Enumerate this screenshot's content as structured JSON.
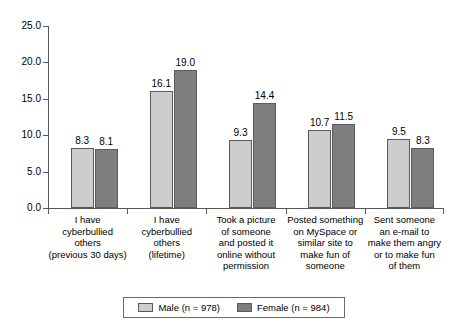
{
  "chart_data": {
    "type": "bar",
    "title": "",
    "subtitle": "",
    "xlabel": "",
    "ylabel": "",
    "ylim": [
      0.0,
      25.0
    ],
    "ytick_labels": [
      "0.0",
      "5.0",
      "10.0",
      "15.0",
      "20.0",
      "25.0"
    ],
    "ytick_values": [
      0.0,
      5.0,
      10.0,
      15.0,
      20.0,
      25.0
    ],
    "grid": false,
    "legend_position": "bottom",
    "categories": [
      "I have\ncyberbullied\nothers\n(previous 30 days)",
      "I have\ncyberbullied\nothers\n(lifetime)",
      "Took a picture\nof someone\nand posted it\nonline without\npermission",
      "Posted something\non MySpace or\nsimilar site to\nmake fun of\nsomeone",
      "Sent someone\nan e-mail to\nmake them angry\nor to make fun\nof them"
    ],
    "category_lines": [
      [
        "I have",
        "cyberbullied",
        "others",
        "(previous 30 days)"
      ],
      [
        "I have",
        "cyberbullied",
        "others",
        "(lifetime)"
      ],
      [
        "Took a picture",
        "of someone",
        "and posted it",
        "online without",
        "permission"
      ],
      [
        "Posted something",
        "on MySpace or",
        "similar site to",
        "make fun of",
        "someone"
      ],
      [
        "Sent someone",
        "an e-mail to",
        "make them angry",
        "or to make fun",
        "of them"
      ]
    ],
    "series": [
      {
        "name": "Male (n = 978)",
        "short_name": "Male",
        "n": 978,
        "color": "#cdcdcd",
        "values": [
          8.3,
          16.1,
          9.3,
          10.7,
          9.5
        ],
        "labels": [
          "8.3",
          "16.1",
          "9.3",
          "10.7",
          "9.5"
        ]
      },
      {
        "name": "Female (n = 984)",
        "short_name": "Female",
        "n": 984,
        "color": "#7e7e7e",
        "values": [
          8.1,
          19.0,
          14.4,
          11.5,
          8.3
        ],
        "labels": [
          "8.1",
          "19.0",
          "14.4",
          "11.5",
          "8.3"
        ]
      }
    ]
  },
  "legend": {
    "entries": [
      {
        "label": "Male (n = 978)",
        "color": "#cdcdcd"
      },
      {
        "label": "Female (n = 984)",
        "color": "#7e7e7e"
      }
    ]
  },
  "axis": {
    "y_labels": [
      "25.0",
      "20.0",
      "15.0",
      "10.0",
      "5.0",
      "0.0"
    ]
  },
  "colors": {
    "male_bar": "#cdcdcd",
    "female_bar": "#7e7e7e",
    "bar_border": "#5b5b5d",
    "axis": "#58585a",
    "background": "#ffffff",
    "text": "#000000"
  }
}
